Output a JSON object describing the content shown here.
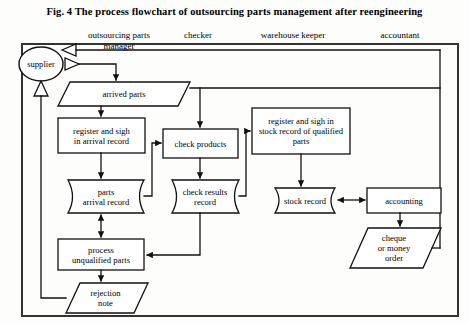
{
  "figure": {
    "title": "Fig. 4 The process flowchart of outsourcing parts management after reengineering",
    "border_color": "#333333",
    "line_color": "#111111",
    "background": "#fdfdfb"
  },
  "lanes": [
    {
      "id": "lane-outsourcing-parts-manager",
      "label": "outsourcing parts\nmanager",
      "x": 118,
      "y": 29
    },
    {
      "id": "lane-checker",
      "label": "checker",
      "x": 197,
      "y": 29
    },
    {
      "id": "lane-warehouse-keeper",
      "label": "warehouse keeper",
      "x": 293,
      "y": 29
    },
    {
      "id": "lane-accountant",
      "label": "accountant",
      "x": 398,
      "y": 29
    }
  ],
  "nodes": [
    {
      "id": "supplier",
      "label": "supplier",
      "shape": "ellipse",
      "cx": 41,
      "cy": 64,
      "rx": 22,
      "ry": 17
    },
    {
      "id": "arrived-parts",
      "label": "arrived parts",
      "shape": "parallelogram",
      "x": 58,
      "y": 82,
      "w": 120,
      "h": 24
    },
    {
      "id": "register-arrival-record",
      "label": "register and  sigh\nin arrival record",
      "shape": "process",
      "x": 58,
      "y": 118,
      "w": 87,
      "h": 35
    },
    {
      "id": "parts-arrival-record",
      "label": "parts\narrival  record",
      "shape": "datastore",
      "x": 60,
      "y": 180,
      "w": 84,
      "h": 33
    },
    {
      "id": "check-products",
      "label": "check  products",
      "shape": "process",
      "x": 163,
      "y": 129,
      "w": 75,
      "h": 29
    },
    {
      "id": "check-results-record",
      "label": "check results\nrecord",
      "shape": "datastore",
      "x": 163,
      "y": 180,
      "w": 76,
      "h": 33
    },
    {
      "id": "register-stock-record-qualified",
      "label": "register and  sigh in\nstock record of qualified\nparts",
      "shape": "process",
      "x": 252,
      "y": 108,
      "w": 98,
      "h": 46
    },
    {
      "id": "stock-record",
      "label": "stock record",
      "shape": "datastore",
      "x": 267,
      "y": 188,
      "w": 68,
      "h": 25
    },
    {
      "id": "accounting",
      "label": "accounting",
      "shape": "process",
      "x": 367,
      "y": 188,
      "w": 74,
      "h": 25
    },
    {
      "id": "process-unqualified-parts",
      "label": "process\nunqualified parts",
      "shape": "process",
      "x": 58,
      "y": 239,
      "w": 86,
      "h": 31
    },
    {
      "id": "rejection-note",
      "label": "rejection\nnote",
      "shape": "parallelogram",
      "x": 66,
      "y": 283,
      "w": 73,
      "h": 30
    },
    {
      "id": "cheque-or-money-order",
      "label": "cheque\nor money\norder",
      "shape": "parallelogram",
      "x": 353,
      "y": 228,
      "w": 80,
      "h": 40
    }
  ],
  "connections": [
    {
      "id": "supplier-to-manager",
      "from": "supplier",
      "to": "outsourcing-parts-manager",
      "arrow": "hollow-left"
    },
    {
      "id": "manager-to-supplier",
      "from": "outsourcing-parts-manager",
      "to": "supplier",
      "arrow": "hollow-right"
    },
    {
      "id": "supplier-to-arrived-parts",
      "from": "supplier",
      "to": "arrived-parts",
      "arrow": "solid-down"
    },
    {
      "id": "rejection-note-to-supplier",
      "from": "rejection-note",
      "to": "supplier",
      "arrow": "hollow-up"
    },
    {
      "id": "arrived-parts-to-register-arrival",
      "from": "arrived-parts",
      "to": "register-arrival-record",
      "arrow": "solid-down"
    },
    {
      "id": "register-arrival-to-parts-record",
      "from": "register-arrival-record",
      "to": "parts-arrival-record",
      "arrow": "solid-down"
    },
    {
      "id": "parts-record-to-check-products",
      "from": "parts-arrival-record",
      "to": "check-products",
      "arrow": "solid-right"
    },
    {
      "id": "parts-record-process-unqualified",
      "from": "parts-arrival-record",
      "to": "process-unqualified-parts",
      "arrow": "double"
    },
    {
      "id": "top-line-to-check-products",
      "from": "arrived-parts",
      "to": "check-products",
      "arrow": "solid-down"
    },
    {
      "id": "check-products-to-check-results",
      "from": "check-products",
      "to": "check-results-record",
      "arrow": "solid-down"
    },
    {
      "id": "check-results-to-register-stock",
      "from": "check-results-record",
      "to": "register-stock-record-qualified",
      "arrow": "solid-right"
    },
    {
      "id": "check-results-to-process-unqualified",
      "from": "check-results-record",
      "to": "process-unqualified-parts",
      "arrow": "solid-left"
    },
    {
      "id": "register-stock-to-stock-record",
      "from": "register-stock-record-qualified",
      "to": "stock-record",
      "arrow": "solid-down"
    },
    {
      "id": "stock-record-accounting",
      "from": "stock-record",
      "to": "accounting",
      "arrow": "double"
    },
    {
      "id": "accounting-to-cheque",
      "from": "accounting",
      "to": "cheque-or-money-order",
      "arrow": "solid-down"
    },
    {
      "id": "cheque-to-supplier-return",
      "from": "cheque-or-money-order",
      "to": "supplier",
      "arrow": "line"
    },
    {
      "id": "process-unqualified-to-rejection",
      "from": "process-unqualified-parts",
      "to": "rejection-note",
      "arrow": "solid-down"
    }
  ]
}
